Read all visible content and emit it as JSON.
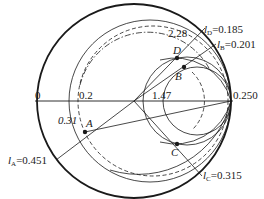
{
  "diagram": {
    "type": "smith-chart-impedance-matching",
    "colors": {
      "line": "#1a1a1a",
      "background": "#ffffff"
    },
    "axis_labels": {
      "left": "0",
      "r_circle_02": "0.2",
      "r_circle_147": "1.47",
      "right": "0.250",
      "r_circle_228": "2.28",
      "g_circle_031": "0.31"
    },
    "points": [
      {
        "name": "A",
        "label": "A"
      },
      {
        "name": "B",
        "label": "B"
      },
      {
        "name": "C",
        "label": "C"
      },
      {
        "name": "D",
        "label": "D"
      }
    ],
    "wavelength_labels": {
      "A": {
        "symbol": "l",
        "sub": "A",
        "value": "=0.451"
      },
      "B": {
        "symbol": "l",
        "sub": "B",
        "value": "=0.201"
      },
      "C": {
        "symbol": "l",
        "sub": "C",
        "value": "=0.315"
      },
      "D": {
        "symbol": "l",
        "sub": "D",
        "value": "=0.185"
      }
    }
  }
}
